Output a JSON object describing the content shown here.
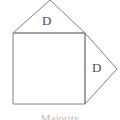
{
  "figure": {
    "background_color": "#ffffff",
    "stroke_color": "#808080",
    "label_color": "#4d4d4d",
    "caption_color": "#b9b9b9",
    "caption": "Majority",
    "labels": {
      "top_triangle": "D",
      "right_triangle": "D"
    },
    "geometry": {
      "square": {
        "top_left": "13,33",
        "top_right": "85,33",
        "bottom_right": "85,104",
        "bottom_left": "13,104",
        "points": "13,33 85,33 85,104 13,104"
      },
      "top_triangle": {
        "apex": "50,0",
        "points": "13,33 50,0 85,33"
      },
      "right_triangle": {
        "apex": "117,69",
        "points": "85,33 117,69 85,104"
      }
    }
  }
}
